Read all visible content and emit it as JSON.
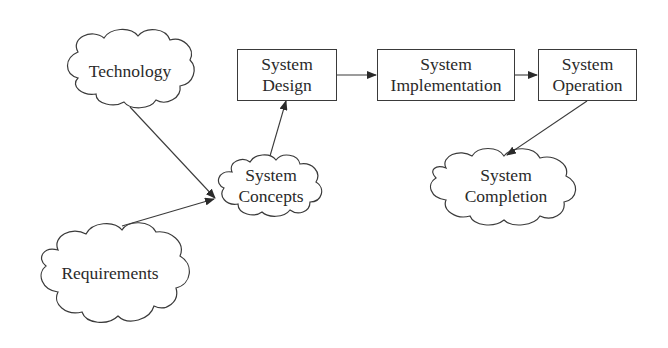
{
  "diagram": {
    "type": "flow",
    "nodes": {
      "technology": {
        "shape": "cloud",
        "lines": [
          "Technology"
        ]
      },
      "requirements": {
        "shape": "cloud",
        "lines": [
          "Requirements"
        ]
      },
      "system_concepts": {
        "shape": "cloud",
        "lines": [
          "System",
          "Concepts"
        ]
      },
      "system_design": {
        "shape": "box",
        "lines": [
          "System",
          "Design"
        ]
      },
      "system_implementation": {
        "shape": "box",
        "lines": [
          "System",
          "Implementation"
        ]
      },
      "system_operation": {
        "shape": "box",
        "lines": [
          "System",
          "Operation"
        ]
      },
      "system_completion": {
        "shape": "cloud",
        "lines": [
          "System",
          "Completion"
        ]
      }
    },
    "edges": [
      {
        "from": "Technology",
        "to": "System Concepts"
      },
      {
        "from": "Requirements",
        "to": "System Concepts"
      },
      {
        "from": "System Concepts",
        "to": "System Design"
      },
      {
        "from": "System Design",
        "to": "System Implementation"
      },
      {
        "from": "System Implementation",
        "to": "System Operation"
      },
      {
        "from": "System Operation",
        "to": "System Completion"
      }
    ],
    "colors": {
      "stroke": "#3a3a3a",
      "text": "#2a2a2a",
      "background": "#ffffff"
    }
  }
}
